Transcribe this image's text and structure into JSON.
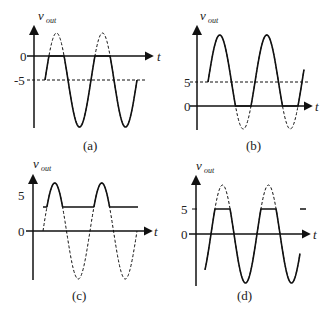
{
  "figure": {
    "panels": [
      {
        "id": "a",
        "caption": "(a)",
        "y_label": "v",
        "y_sub": "out",
        "x_label": "t",
        "levels": [
          {
            "label": "0",
            "value": 0
          },
          {
            "label": "-5",
            "value": -5
          }
        ],
        "description": "Sinusoid shifted down so it is centered at -5; solid where below 0, dashed above 0 (clamped negative)."
      },
      {
        "id": "b",
        "caption": "(b)",
        "y_label": "v",
        "y_sub": "out",
        "x_label": "t",
        "levels": [
          {
            "label": "5",
            "value": 5
          },
          {
            "label": "0",
            "value": 0
          }
        ],
        "description": "Sinusoid shifted up, centered at +5; solid above 0, dashed below 0 (clamped positive)."
      },
      {
        "id": "c",
        "caption": "(c)",
        "y_label": "v",
        "y_sub": "out",
        "x_label": "t",
        "levels": [
          {
            "label": "5",
            "value": 5
          },
          {
            "label": "0",
            "value": 0
          }
        ],
        "description": "Sinusoid centered at 0 with output limited from below at a positive level; solid above level, dashed below."
      },
      {
        "id": "d",
        "caption": "(d)",
        "y_label": "v",
        "y_sub": "out",
        "x_label": "t",
        "levels": [
          {
            "label": "5",
            "value": 5
          },
          {
            "label": "0",
            "value": 0
          }
        ],
        "description": "Sinusoid centered at 0 clipped at +5; solid waveform with flat tops at 5, dashed peaks above."
      }
    ]
  }
}
